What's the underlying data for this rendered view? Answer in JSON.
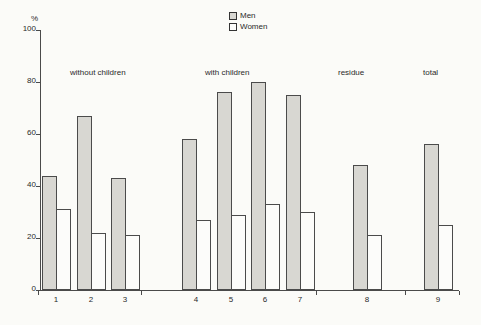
{
  "chart_data": {
    "type": "bar",
    "title": "",
    "xlabel": "",
    "ylabel": "%",
    "ylim": [
      0,
      100
    ],
    "yticks": [
      0,
      20,
      40,
      60,
      80,
      100
    ],
    "grid": false,
    "legend_position": "top-center",
    "categories": [
      "1",
      "2",
      "3",
      "4",
      "5",
      "6",
      "7",
      "8",
      "9"
    ],
    "series": [
      {
        "name": "Men",
        "color": "#d8d7d2",
        "values": [
          44,
          67,
          43,
          58,
          76,
          80,
          75,
          48,
          56
        ]
      },
      {
        "name": "Women",
        "color": "#fcfcfa",
        "values": [
          31,
          22,
          21,
          27,
          29,
          33,
          30,
          21,
          25
        ]
      }
    ],
    "group_labels": [
      {
        "text": "without children",
        "categories": [
          "1",
          "2",
          "3"
        ]
      },
      {
        "text": "with children",
        "categories": [
          "4",
          "5",
          "6",
          "7"
        ]
      },
      {
        "text": "residue",
        "categories": [
          "8"
        ]
      },
      {
        "text": "total",
        "categories": [
          "9"
        ]
      }
    ]
  }
}
